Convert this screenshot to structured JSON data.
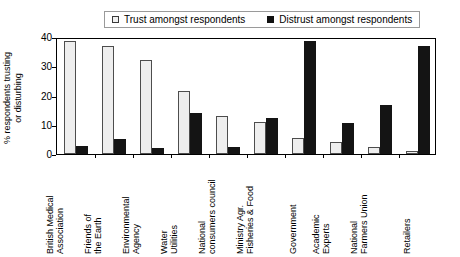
{
  "chart_data": {
    "type": "bar",
    "title": "",
    "subtitle": "",
    "xlabel": "",
    "ylabel": "% respondents trusting or disturbing",
    "ylabel_lines": [
      "% respondents trusting",
      "or disturbing"
    ],
    "ylim": [
      0,
      40
    ],
    "yticks": [
      0,
      10,
      20,
      30,
      40
    ],
    "ytick_labels": [
      "0",
      "10",
      "20",
      "30",
      "40"
    ],
    "grid": false,
    "legend_position": "top-center",
    "categories": [
      "British Medical Association",
      "Friends of the Earth",
      "Environmental Agency",
      "Water Utilities",
      "National consumers council",
      "Ministry Agr. Fisheries & Food",
      "Government",
      "Academic Experts",
      "National Farmers Union",
      "Retailers"
    ],
    "category_lines": [
      [
        "British Medical",
        "Association"
      ],
      [
        "Friends of",
        "the Earth"
      ],
      [
        "Environmental",
        "Agency"
      ],
      [
        "Water",
        "Utilities"
      ],
      [
        "National",
        "consumers council"
      ],
      [
        "Ministry Agr.",
        "Fisheries & Food"
      ],
      [
        "Government"
      ],
      [
        "Academic",
        "Experts"
      ],
      [
        "National",
        "Farmers Union"
      ],
      [
        "Retailers"
      ]
    ],
    "series": [
      {
        "name": "Trust amongst respondents",
        "color": "#eeeeee",
        "values": [
          38.7,
          37.0,
          32.1,
          21.5,
          13.0,
          11.0,
          5.5,
          4.0,
          2.5,
          1.0
        ]
      },
      {
        "name": "Distrust amongst respondents",
        "color": "#141414",
        "values": [
          2.6,
          5.3,
          2.0,
          14.0,
          2.4,
          12.4,
          38.7,
          10.5,
          16.8,
          36.8
        ]
      }
    ]
  },
  "legend": {
    "entries": [
      {
        "label": "Trust amongst respondents",
        "swatch": "open-square-marker"
      },
      {
        "label": "Distrust amongst respondents",
        "swatch": "filled-square-marker"
      }
    ]
  }
}
